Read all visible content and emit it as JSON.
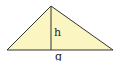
{
  "diagram": {
    "shape": "triangle",
    "fill_color": "#fbf5c2",
    "stroke_color": "#333333",
    "labels": {
      "height": "h",
      "base": "g"
    }
  }
}
